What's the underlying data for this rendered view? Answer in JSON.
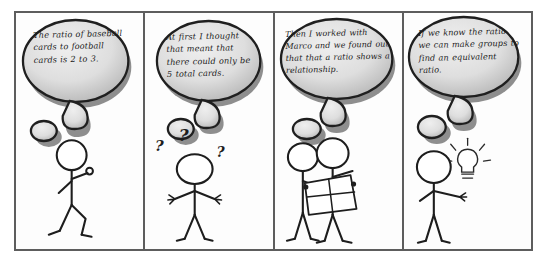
{
  "comic": {
    "title": "Ratio reasoning stick-figure comic strip",
    "panel_count": 4,
    "style": {
      "frame_border_color": "#5d5d5d",
      "background_color": "#ffffff",
      "ink_color": "#1d1d1d",
      "bubble_fill_light": "#e8e8e8",
      "bubble_fill_dark": "#b4b4b4",
      "bubble_outline_color": "#1f1f1f",
      "bubble_shadow_color": "#8e8e8e"
    },
    "panels": [
      {
        "id": "panel-1",
        "thought_text": "The ratio of baseball cards to football cards is 2 to 3.",
        "thought_lines": [
          "The ratio of",
          "baseball cards",
          "to football",
          "cards is 2 to 3."
        ],
        "figure_description": "stick figure walking with one arm raised",
        "figure_count": 1,
        "props": []
      },
      {
        "id": "panel-2",
        "thought_text": "At first I thought that meant that there could only be 5 total cards.",
        "thought_lines": [
          "At first I",
          "thought that",
          "meant that there",
          "could only be 5",
          "total cards."
        ],
        "figure_description": "confused stick figure shrugging with question marks",
        "figure_count": 1,
        "props": [
          "question-mark",
          "question-mark",
          "question-mark"
        ]
      },
      {
        "id": "panel-3",
        "thought_text": "Then I worked with Marco and we found out that that a ratio shows a relationship.",
        "thought_lines": [
          "Then I worked with",
          "Marco and we found",
          "out that that a ratio",
          "shows a",
          "relationship."
        ],
        "figure_description": "two stick figures holding a sheet of paper with a grid",
        "figure_count": 2,
        "props": [
          "paper-sheet"
        ]
      },
      {
        "id": "panel-4",
        "thought_text": "If we know the ratio we can make groups to find an equivalent ratio.",
        "thought_lines": [
          "If we know the",
          "ratio we can",
          "make groups to",
          "find an",
          "equivalent ratio."
        ],
        "figure_description": "stick figure with a glowing idea lightbulb",
        "figure_count": 1,
        "props": [
          "lightbulb-icon"
        ]
      }
    ]
  }
}
